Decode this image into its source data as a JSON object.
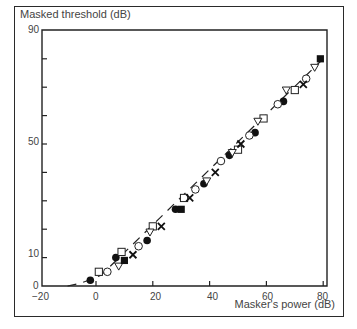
{
  "chart_data": {
    "type": "scatter",
    "title": "",
    "xlabel": "Masker's power (dB)",
    "ylabel": "Masked threshold (dB)",
    "xlim": [
      -20,
      82
    ],
    "ylim": [
      0,
      90
    ],
    "x_ticks": [
      "-20",
      "0",
      "20",
      "40",
      "60",
      "80"
    ],
    "y_ticks": [
      "0",
      "10",
      "50",
      "90"
    ],
    "y_minor_ticks": [
      20,
      30,
      40,
      60,
      70,
      80
    ],
    "grid": false,
    "legend": null,
    "fit_line": "dashed line through points, curving to horizontal near x=-10",
    "series": [
      {
        "name": "filled-circle",
        "marker": "●",
        "points": [
          [
            -2,
            2
          ],
          [
            7,
            10
          ],
          [
            18,
            16
          ],
          [
            28,
            27
          ],
          [
            38,
            36
          ],
          [
            47,
            46
          ],
          [
            56,
            54
          ],
          [
            66,
            65
          ]
        ]
      },
      {
        "name": "open-square",
        "marker": "□",
        "points": [
          [
            1,
            5
          ],
          [
            9,
            12
          ],
          [
            20,
            21
          ],
          [
            31,
            31
          ],
          [
            50,
            48
          ],
          [
            59,
            59
          ],
          [
            70,
            69
          ]
        ]
      },
      {
        "name": "open-circle",
        "marker": "○",
        "points": [
          [
            4,
            5
          ],
          [
            15,
            14
          ],
          [
            35,
            34
          ],
          [
            44,
            44
          ],
          [
            54,
            53
          ],
          [
            64,
            64
          ],
          [
            74,
            73
          ]
        ]
      },
      {
        "name": "open-triangle-down",
        "marker": "▽",
        "points": [
          [
            8,
            7
          ],
          [
            19,
            19
          ],
          [
            39,
            37
          ],
          [
            48,
            47
          ],
          [
            57,
            58
          ],
          [
            67,
            69
          ],
          [
            77,
            77
          ]
        ]
      },
      {
        "name": "filled-square",
        "marker": "■",
        "points": [
          [
            10,
            9
          ],
          [
            30,
            27
          ],
          [
            79,
            80
          ]
        ]
      },
      {
        "name": "cross",
        "marker": "×",
        "points": [
          [
            13,
            11
          ],
          [
            23,
            21
          ],
          [
            33,
            31
          ],
          [
            42,
            40
          ],
          [
            51,
            50
          ],
          [
            73,
            71
          ]
        ]
      }
    ]
  },
  "labels": {
    "y_axis_title": "Masked threshold (dB)",
    "x_axis_title": "Masker's power (dB)",
    "y90": "90",
    "y50": "50",
    "y10": "10",
    "y0": "0",
    "xm20": "−20",
    "x0": "0",
    "x20": "20",
    "x40": "40",
    "x60": "60",
    "x80": "80"
  }
}
